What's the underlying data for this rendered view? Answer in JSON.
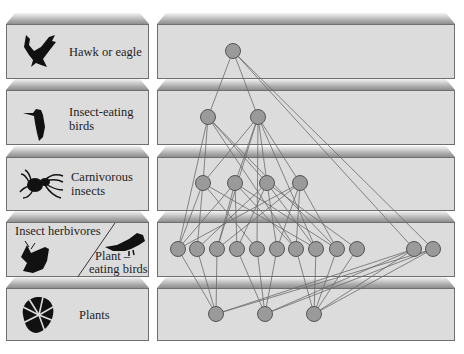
{
  "levels": [
    {
      "label": "Hawk or eagle",
      "icon": "hawk-icon"
    },
    {
      "label_line1": "Insect-eating",
      "label_line2": "birds",
      "icon": "bird-icon"
    },
    {
      "label_line1": "Carnivorous",
      "label_line2": "insects",
      "icon": "spider-icon"
    },
    {
      "label_left": "Insect herbivores",
      "label_right_line1": "Plant –",
      "label_right_line2": "eating birds",
      "icon_left": "moth-icon",
      "icon_right": "parrot-icon"
    },
    {
      "label": "Plants",
      "icon": "leaf-icon"
    }
  ],
  "colors": {
    "node_fill": "#9a9a9a",
    "node_stroke": "#555555",
    "edge": "#6a6a6a",
    "panel_face": "#dcdcdc"
  },
  "network": {
    "nodes": {
      "hawk": [
        [
          233,
          51
        ]
      ],
      "insect_birds": [
        [
          208,
          117
        ],
        [
          258,
          117
        ]
      ],
      "carn_insects": [
        [
          203,
          183
        ],
        [
          235,
          183
        ],
        [
          267,
          183
        ],
        [
          300,
          183
        ]
      ],
      "herbivores": [
        [
          178,
          249
        ],
        [
          197,
          249
        ],
        [
          217,
          249
        ],
        [
          237,
          249
        ],
        [
          257,
          249
        ],
        [
          277,
          249
        ],
        [
          296,
          249
        ],
        [
          316,
          249
        ],
        [
          337,
          249
        ],
        [
          357,
          249
        ]
      ],
      "plant_birds": [
        [
          414,
          249
        ],
        [
          433,
          249
        ]
      ],
      "plants": [
        [
          216,
          314
        ],
        [
          265,
          314
        ],
        [
          314,
          314
        ]
      ]
    },
    "edges": [
      [
        233,
        51,
        208,
        117
      ],
      [
        233,
        51,
        258,
        117
      ],
      [
        233,
        51,
        414,
        249
      ],
      [
        233,
        51,
        433,
        249
      ],
      [
        208,
        117,
        203,
        183
      ],
      [
        208,
        117,
        267,
        183
      ],
      [
        208,
        117,
        178,
        249
      ],
      [
        208,
        117,
        296,
        249
      ],
      [
        208,
        117,
        337,
        249
      ],
      [
        258,
        117,
        203,
        183
      ],
      [
        258,
        117,
        235,
        183
      ],
      [
        258,
        117,
        267,
        183
      ],
      [
        258,
        117,
        300,
        183
      ],
      [
        258,
        117,
        217,
        249
      ],
      [
        258,
        117,
        257,
        249
      ],
      [
        258,
        117,
        316,
        249
      ],
      [
        203,
        183,
        178,
        249
      ],
      [
        203,
        183,
        197,
        249
      ],
      [
        203,
        183,
        257,
        249
      ],
      [
        203,
        183,
        317,
        249
      ],
      [
        235,
        183,
        178,
        249
      ],
      [
        235,
        183,
        217,
        249
      ],
      [
        235,
        183,
        237,
        249
      ],
      [
        235,
        183,
        296,
        249
      ],
      [
        235,
        183,
        337,
        249
      ],
      [
        267,
        183,
        197,
        249
      ],
      [
        267,
        183,
        237,
        249
      ],
      [
        267,
        183,
        277,
        249
      ],
      [
        267,
        183,
        316,
        249
      ],
      [
        267,
        183,
        357,
        249
      ],
      [
        300,
        183,
        178,
        249
      ],
      [
        300,
        183,
        217,
        249
      ],
      [
        300,
        183,
        277,
        249
      ],
      [
        300,
        183,
        296,
        249
      ],
      [
        300,
        183,
        337,
        249
      ],
      [
        178,
        249,
        216,
        314
      ],
      [
        197,
        249,
        216,
        314
      ],
      [
        217,
        249,
        216,
        314
      ],
      [
        237,
        249,
        265,
        314
      ],
      [
        257,
        249,
        265,
        314
      ],
      [
        277,
        249,
        265,
        314
      ],
      [
        296,
        249,
        314,
        314
      ],
      [
        316,
        249,
        314,
        314
      ],
      [
        337,
        249,
        314,
        314
      ],
      [
        357,
        249,
        314,
        314
      ],
      [
        414,
        249,
        216,
        314
      ],
      [
        414,
        249,
        265,
        314
      ],
      [
        414,
        249,
        314,
        314
      ],
      [
        433,
        249,
        216,
        314
      ],
      [
        433,
        249,
        265,
        314
      ],
      [
        433,
        249,
        314,
        314
      ]
    ]
  }
}
